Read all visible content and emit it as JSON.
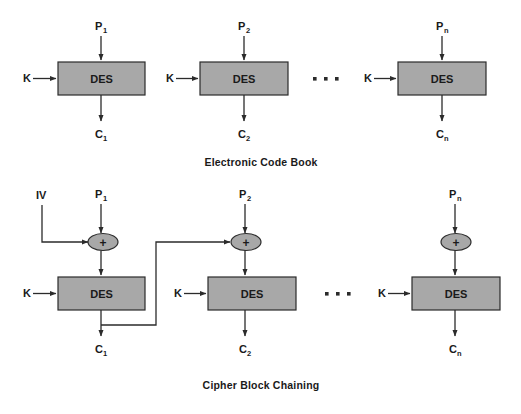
{
  "figure": {
    "background": "#ffffff",
    "box_fill": "#a8a8a8",
    "line_color": "#2b2b2b",
    "text_color": "#1a1a1a"
  },
  "sections": [
    {
      "id": "ecb",
      "caption": "Electronic Code Book",
      "caption_x": 261,
      "caption_y": 166,
      "ellipsis": {
        "x": 313,
        "y": 78,
        "count": 3,
        "spacing": 11
      },
      "blocks": [
        {
          "id": "ecb-block-1",
          "box": {
            "x": 58,
            "y": 62,
            "w": 87,
            "h": 33
          },
          "box_label": "DES",
          "key_label": "K",
          "key_label_x": 23,
          "plain_label": "P",
          "plain_sub": "1",
          "cipher_label": "C",
          "cipher_sub": "1",
          "center_x": 101
        },
        {
          "id": "ecb-block-2",
          "box": {
            "x": 200,
            "y": 62,
            "w": 88,
            "h": 33
          },
          "box_label": "DES",
          "key_label": "K",
          "key_label_x": 166,
          "plain_label": "P",
          "plain_sub": "2",
          "cipher_label": "C",
          "cipher_sub": "2",
          "center_x": 244
        },
        {
          "id": "ecb-block-n",
          "box": {
            "x": 398,
            "y": 62,
            "w": 88,
            "h": 33
          },
          "box_label": "DES",
          "key_label": "K",
          "key_label_x": 364,
          "plain_label": "P",
          "plain_sub": "n",
          "cipher_label": "C",
          "cipher_sub": "n",
          "center_x": 442
        }
      ]
    },
    {
      "id": "cbc",
      "caption": "Cipher Block Chaining",
      "caption_x": 261,
      "caption_y": 389,
      "iv_label": "IV",
      "iv_label_x": 36,
      "iv_label_y": 199,
      "xor_glyph": "+",
      "ellipsis": {
        "x": 325,
        "y": 293,
        "count": 3,
        "spacing": 11
      },
      "blocks": [
        {
          "id": "cbc-block-1",
          "box": {
            "x": 58,
            "y": 277,
            "w": 87,
            "h": 33
          },
          "box_label": "DES",
          "key_label": "K",
          "key_label_x": 23,
          "plain_label": "P",
          "plain_sub": "1",
          "cipher_label": "C",
          "cipher_sub": "1",
          "center_x": 101,
          "xor_y": 242
        },
        {
          "id": "cbc-block-2",
          "box": {
            "x": 208,
            "y": 277,
            "w": 88,
            "h": 33
          },
          "box_label": "DES",
          "key_label": "K",
          "key_label_x": 174,
          "plain_label": "P",
          "plain_sub": "2",
          "cipher_label": "C",
          "cipher_sub": "2",
          "center_x": 245,
          "xor_y": 242
        },
        {
          "id": "cbc-block-n",
          "box": {
            "x": 412,
            "y": 277,
            "w": 88,
            "h": 33
          },
          "box_label": "DES",
          "key_label": "K",
          "key_label_x": 378,
          "plain_label": "P",
          "plain_sub": "n",
          "cipher_label": "C",
          "cipher_sub": "n",
          "center_x": 455,
          "xor_y": 242
        }
      ]
    }
  ]
}
